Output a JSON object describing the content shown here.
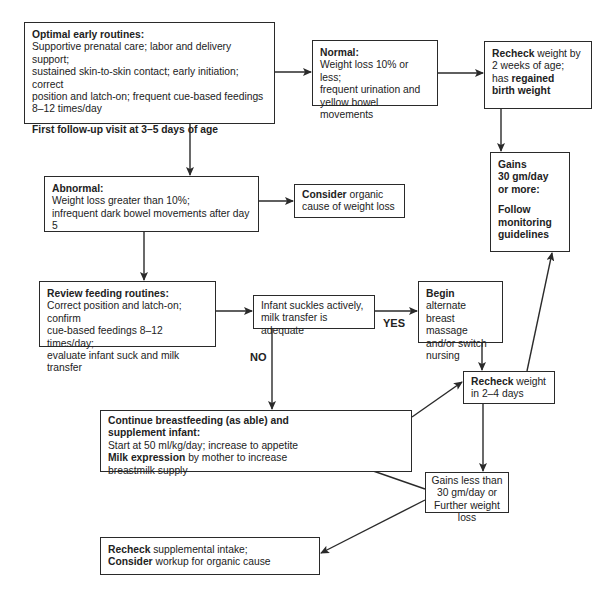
{
  "nodes": {
    "optimal": {
      "title": "Optimal early routines:",
      "lines": [
        "Supportive prenatal care; labor and delivery support;",
        "sustained skin-to-skin contact; early initiation; correct",
        "position and latch-on; frequent cue-based feedings",
        "8–12 times/day"
      ],
      "footer": "First follow-up visit at 3–5 days of age"
    },
    "normal": {
      "title": "Normal:",
      "lines": [
        "Weight loss 10% or less;",
        "frequent urination and",
        "yellow bowel movements"
      ]
    },
    "recheck_two_weeks": {
      "bold1": "Recheck",
      "text1": " weight by",
      "line2": "2 weeks of age;",
      "text3": "has ",
      "bold3": "regained",
      "bold4": "birth weight"
    },
    "gains_30": {
      "lines_bold": [
        "Gains",
        "30 gm/day",
        "or more:"
      ],
      "footer_bold": [
        "Follow",
        "monitoring",
        "guidelines"
      ]
    },
    "abnormal": {
      "title": "Abnormal:",
      "lines": [
        "Weight loss greater than 10%;",
        "infrequent dark bowel movements after day 5"
      ]
    },
    "consider_organic": {
      "bold": "Consider",
      "text1": " organic",
      "line2": "cause of weight loss"
    },
    "review": {
      "title": "Review feeding routines:",
      "lines": [
        "Correct position and latch-on; confirm",
        "cue-based feedings 8–12 times/day;",
        "evaluate infant suck and milk transfer"
      ]
    },
    "suckles": {
      "lines": [
        "Infant suckles actively,",
        "milk transfer is adequate"
      ]
    },
    "begin": {
      "bold": "Begin",
      "text1": " alternate",
      "lines": [
        "breast massage",
        "and/or switch",
        "nursing"
      ]
    },
    "recheck_2_4": {
      "bold": "Recheck",
      "text1": " weight",
      "line2": "in 2–4 days"
    },
    "continue": {
      "title1": "Continue breastfeeding (as able) and",
      "title2": "supplement infant:",
      "line1": "Start at 50 ml/kg/day; increase to appetite",
      "bold2": "Milk expression",
      "text2": " by mother to increase",
      "line3": "breastmilk supply"
    },
    "gains_less": {
      "lines": [
        "Gains less than",
        "30 gm/day or",
        "Further weight loss"
      ]
    },
    "recheck_supp": {
      "bold1": "Recheck",
      "text1": " supplemental intake;",
      "bold2": "Consider",
      "text2": " workup for organic cause"
    }
  },
  "edge_labels": {
    "yes": "YES",
    "no": "NO"
  },
  "colors": {
    "line": "#2a2a2a",
    "background": "#ffffff",
    "text": "#222222"
  }
}
